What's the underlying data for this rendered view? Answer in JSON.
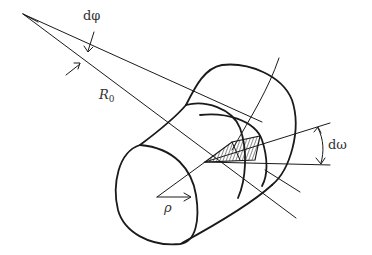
{
  "figure": {
    "labels": {
      "dphi": "dφ",
      "R0_main": "R",
      "R0_sub": "0",
      "rho": "ρ",
      "domega": "dω"
    },
    "colors": {
      "line": "#1a1a1a",
      "text": "#333333",
      "background": "#ffffff"
    }
  }
}
